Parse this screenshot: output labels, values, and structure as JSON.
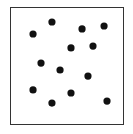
{
  "figure": {
    "dot_count": 13,
    "dot_color": "#111111",
    "frame_color": "#333333",
    "background": "#ffffff",
    "dots": [
      {
        "x": 0.368,
        "y": 0.127
      },
      {
        "x": 0.202,
        "y": 0.229
      },
      {
        "x": 0.632,
        "y": 0.186
      },
      {
        "x": 0.825,
        "y": 0.161
      },
      {
        "x": 0.535,
        "y": 0.347
      },
      {
        "x": 0.728,
        "y": 0.331
      },
      {
        "x": 0.272,
        "y": 0.475
      },
      {
        "x": 0.439,
        "y": 0.534
      },
      {
        "x": 0.684,
        "y": 0.585
      },
      {
        "x": 0.202,
        "y": 0.703
      },
      {
        "x": 0.535,
        "y": 0.729
      },
      {
        "x": 0.368,
        "y": 0.814
      },
      {
        "x": 0.851,
        "y": 0.797
      }
    ]
  }
}
